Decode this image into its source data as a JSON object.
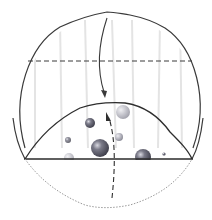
{
  "diagram": {
    "colors": {
      "outline": "#3a3a3a",
      "background": "#ffffff",
      "streak": "#e6e6e6",
      "sphere_dark": "#5a5a66",
      "sphere_mid": "#8a8a95",
      "sphere_light": "#b8b8c0",
      "dotted": "#9a9a9a"
    },
    "spheres": [
      {
        "cx": 90,
        "cy": 123,
        "r": 5
      },
      {
        "cx": 68,
        "cy": 140,
        "r": 3
      },
      {
        "cx": 99,
        "cy": 148,
        "r": 9
      },
      {
        "cx": 119,
        "cy": 137,
        "r": 4
      },
      {
        "cx": 142,
        "cy": 156,
        "r": 8
      },
      {
        "cx": 165,
        "cy": 154,
        "r": 1.5
      },
      {
        "cx": 68,
        "cy": 157,
        "r": 4
      },
      {
        "cx": 123,
        "cy": 113,
        "r": 6
      }
    ]
  }
}
